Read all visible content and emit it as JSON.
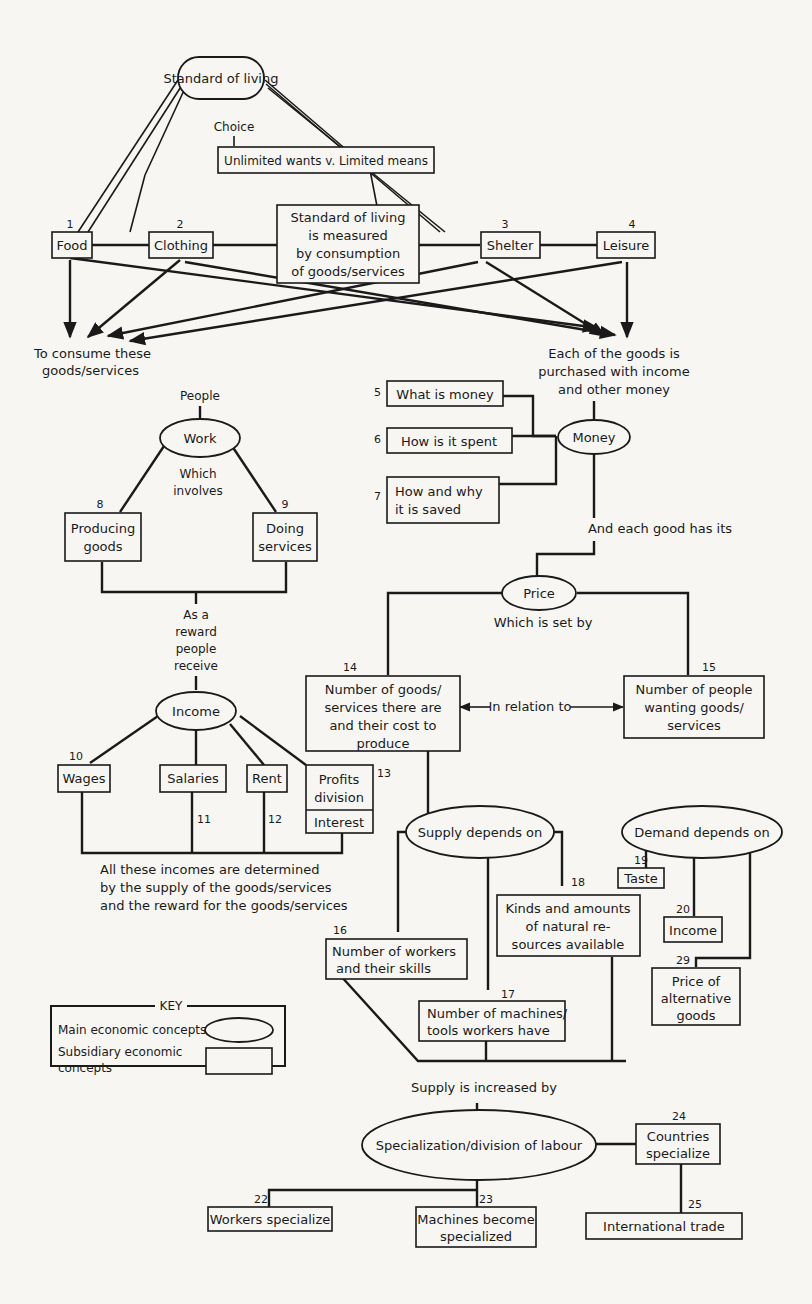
{
  "title": "Standard of living",
  "choice": {
    "label": "Choice",
    "box": "Unlimited wants v. Limited means"
  },
  "needs": [
    {
      "num": "1",
      "label": "Food"
    },
    {
      "num": "2",
      "label": "Clothing"
    },
    {
      "num": "3",
      "label": "Shelter"
    },
    {
      "num": "4",
      "label": "Leisure"
    }
  ],
  "measure_box": [
    "Standard of living",
    "is measured",
    "by consumption",
    "of goods/services"
  ],
  "consume_label": [
    "To consume these",
    "goods/services"
  ],
  "purchase_label": [
    "Each of the goods is",
    "purchased with income",
    "and other money"
  ],
  "people_label": "People",
  "work": {
    "label": "Work",
    "connector": [
      "Which",
      "involves"
    ],
    "children": [
      {
        "num": "8",
        "lines": [
          "Producing",
          "goods"
        ]
      },
      {
        "num": "9",
        "lines": [
          "Doing",
          "services"
        ]
      }
    ]
  },
  "reward_label": [
    "As a",
    "reward",
    "people",
    "receive"
  ],
  "income": {
    "label": "Income",
    "children": [
      {
        "num": "10",
        "label": "Wages"
      },
      {
        "num": "11",
        "label": "Salaries"
      },
      {
        "num": "12",
        "label": "Rent"
      },
      {
        "num": "13",
        "lines": [
          "Profits",
          "division"
        ],
        "sub": "Interest"
      }
    ],
    "note": [
      "All these incomes are determined",
      "by the supply of the goods/services",
      "and the reward for the goods/services"
    ]
  },
  "money": {
    "label": "Money",
    "children": [
      {
        "num": "5",
        "lines": [
          "What is money"
        ]
      },
      {
        "num": "6",
        "lines": [
          "How is it spent"
        ]
      },
      {
        "num": "7",
        "lines": [
          "How and why",
          "it is saved"
        ]
      }
    ],
    "connector": "And each good has its"
  },
  "price": {
    "label": "Price",
    "connector": "Which is set by",
    "left": {
      "num": "14",
      "lines": [
        "Number of goods/",
        "services there are",
        "and their cost to",
        "produce"
      ]
    },
    "relation": "In relation to",
    "right": {
      "num": "15",
      "lines": [
        "Number of people",
        "wanting goods/",
        "services"
      ]
    }
  },
  "supply": {
    "label": "Supply depends on",
    "children": [
      {
        "num": "16",
        "lines": [
          "Number of workers",
          "and their skills"
        ]
      },
      {
        "num": "17",
        "lines": [
          "Number of machines/",
          "tools workers have"
        ]
      },
      {
        "num": "18",
        "lines": [
          "Kinds and amounts",
          "of natural re-",
          "sources available"
        ]
      }
    ],
    "increase_label": "Supply is increased by"
  },
  "demand": {
    "label": "Demand depends on",
    "children": [
      {
        "num": "19",
        "lines": [
          "Taste"
        ]
      },
      {
        "num": "20",
        "lines": [
          "Income"
        ]
      },
      {
        "num": "29",
        "lines": [
          "Price of",
          "alternative",
          "goods"
        ]
      }
    ]
  },
  "specialization": {
    "label": "Specialization/division of labour",
    "children": [
      {
        "num": "22",
        "lines": [
          "Workers specialize"
        ]
      },
      {
        "num": "23",
        "lines": [
          "Machines become",
          "specialized"
        ]
      },
      {
        "num": "24",
        "lines": [
          "Countries",
          "specialize"
        ]
      },
      {
        "num": "25",
        "lines": [
          "International trade"
        ]
      }
    ]
  },
  "key": {
    "title": "KEY",
    "main": "Main economic concepts",
    "subsidiary": [
      "Subsidiary economic",
      "concepts"
    ]
  }
}
